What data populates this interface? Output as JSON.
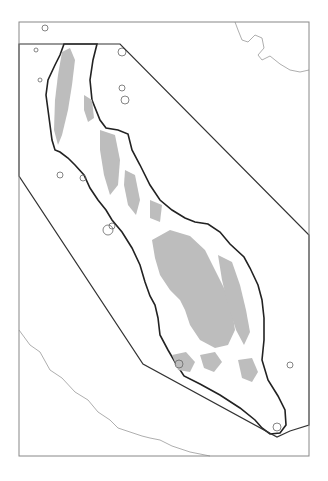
{
  "map": {
    "width": 328,
    "height": 481,
    "colors": {
      "background": "#ffffff",
      "frame": "#888888",
      "boundary": "#333333",
      "coast": "#222222",
      "highland": "#bdbdbd",
      "neighbor_coast": "#999999",
      "islands": "#666666"
    },
    "frame": {
      "x": 19,
      "y": 22,
      "w": 290,
      "h": 434
    },
    "study_area_polygon": "19,44 120,44 309,235 309,425 290,431 277,437 143,364 19,176",
    "peninsula_outline": "M97,44 L93,60 L90,80 L92,100 L100,120 L106,128 L118,130 L128,134 L132,150 L140,165 L150,185 L160,200 L172,210 L185,218 L195,222 L208,224 L220,232 L230,244 L244,257 L250,268 L258,285 L262,300 L264,318 L264,340 L262,360 L268,380 L278,396 L285,410 L286,425 L280,433 L270,434 L262,428 L255,420 L240,408 L220,395 L200,384 L184,376 L175,362 L168,350 L160,335 L158,318 L155,305 L150,296 L145,282 L140,265 L132,248 L122,232 L112,220 L106,210 L98,200 L90,188 L84,175 L75,165 L68,158 L60,152 L55,150 L52,140 L50,125 L48,110 L46,95 L48,80 L55,65 L60,55 L64,44 Z",
    "highlands": [
      "M62,52 L70,48 L75,60 L72,85 L68,110 L62,135 L58,145 L54,130 L55,100 L58,75 Z",
      "M100,130 L115,135 L120,160 L118,185 L110,195 L104,175 L100,150 Z",
      "M125,170 L135,175 L140,200 L136,215 L128,205 L124,185 Z",
      "M152,240 L170,230 L190,236 L205,250 L215,270 L225,290 L232,310 L235,330 L228,345 L215,348 L200,340 L190,325 L185,310 L180,300 L170,290 L160,275 L155,258 Z",
      "M218,255 L232,262 L240,285 L246,310 L250,332 L244,345 L236,330 L228,305 L222,280 Z",
      "M172,355 L186,352 L195,362 L190,372 L178,370 Z",
      "M200,355 L215,352 L222,362 L214,372 L204,368 Z",
      "M238,360 L252,358 L258,372 L252,382 L242,378 Z",
      "M150,200 L162,205 L160,222 L150,218 Z",
      "M84,95 L92,100 L94,118 L88,122 L84,110 Z"
    ],
    "neighbor_coast_sw": "M19,330 L30,345 L40,352 L50,370 L62,378 L75,392 L88,400 L98,412 L110,420 L118,428 L130,432 L142,436 L150,438 L160,440 L172,446 L190,452 L210,456",
    "neighbor_coast_ne": "M235,22 L238,30 L242,40 L248,42 L255,35 L262,38 L264,48 L258,55 L262,60 L270,56 L280,64 L290,70 L300,72 L309,70",
    "islands": [
      {
        "cx": 60,
        "cy": 175,
        "r": 3
      },
      {
        "cx": 83,
        "cy": 178,
        "r": 3
      },
      {
        "cx": 108,
        "cy": 230,
        "r": 5
      },
      {
        "cx": 112,
        "cy": 226,
        "r": 3
      },
      {
        "cx": 122,
        "cy": 52,
        "r": 4
      },
      {
        "cx": 125,
        "cy": 100,
        "r": 4
      },
      {
        "cx": 122,
        "cy": 88,
        "r": 3
      },
      {
        "cx": 179,
        "cy": 364,
        "r": 4
      },
      {
        "cx": 290,
        "cy": 365,
        "r": 3
      },
      {
        "cx": 277,
        "cy": 427,
        "r": 4
      },
      {
        "cx": 45,
        "cy": 28,
        "r": 3
      },
      {
        "cx": 36,
        "cy": 50,
        "r": 2
      },
      {
        "cx": 40,
        "cy": 80,
        "r": 2
      }
    ]
  }
}
